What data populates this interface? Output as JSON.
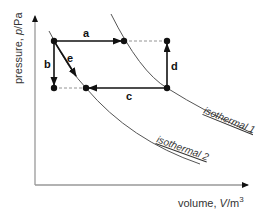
{
  "diagram": {
    "type": "pV-diagram",
    "axes": {
      "y_label": "pressure, ",
      "y_symbol": "p",
      "y_unit": "/Pa",
      "x_label": "volume, ",
      "x_symbol": "V",
      "x_unit": "/m",
      "x_unit_exp": "3"
    },
    "processes": {
      "a": "a",
      "b": "b",
      "c": "c",
      "d": "d",
      "e": "e"
    },
    "isotherms": {
      "one": "isothermal 1",
      "two": "isothermal 2"
    },
    "colors": {
      "axis": "#999999",
      "process": "#111111",
      "curve": "#555555",
      "dashed": "#888888"
    }
  }
}
